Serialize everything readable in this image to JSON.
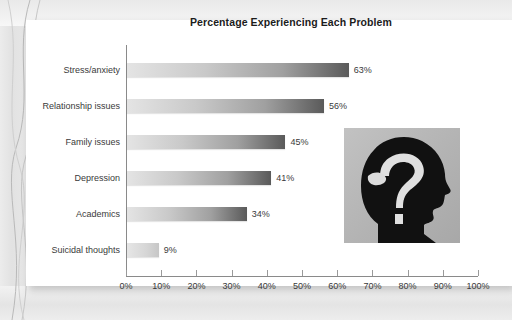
{
  "slide": {
    "background_color": "#e8e8e8",
    "panel_color": "#ffffff"
  },
  "chart_data": {
    "type": "bar",
    "orientation": "horizontal",
    "title": "Percentage Experiencing Each Problem",
    "xlabel": "",
    "ylabel": "",
    "xlim": [
      0,
      100
    ],
    "grid": false,
    "legend": "none",
    "categories": [
      "Stress/anxiety",
      "Relationship issues",
      "Family issues",
      "Depression",
      "Academics",
      "Suicidal thoughts"
    ],
    "values": [
      63,
      56,
      45,
      41,
      34,
      9
    ],
    "value_labels": [
      "63%",
      "56%",
      "45%",
      "41%",
      "34%",
      "9%"
    ],
    "tick_values": [
      0,
      10,
      20,
      30,
      40,
      50,
      60,
      70,
      80,
      90,
      100
    ],
    "tick_labels": [
      "0%",
      "10%",
      "20%",
      "30%",
      "40%",
      "50%",
      "60%",
      "70%",
      "80%",
      "90%",
      "100%"
    ],
    "bar_gradient_from": "#e4e4e4",
    "bar_gradient_to": "#5a5a5a",
    "axis_color": "#8a8a8a",
    "text_color": "#3a3a3a",
    "title_color": "#1c1c1c"
  },
  "illustration": {
    "name": "head-brain-question-mark",
    "description": "Black profile silhouette of a head with a light question-mark shaped brain",
    "background_color": "#b4b4b4",
    "silhouette_color": "#111111",
    "brain_color": "#e0e0e0"
  }
}
